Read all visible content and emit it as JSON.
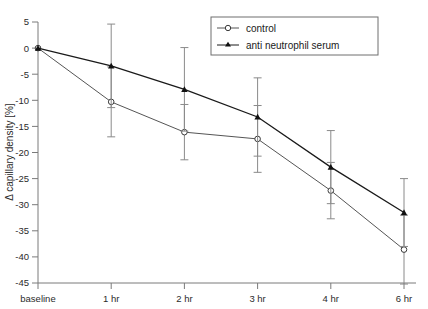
{
  "chart_data": {
    "type": "line",
    "title": "",
    "xlabel": "",
    "ylabel": "Δ capillary density [%]",
    "categories": [
      "baseline",
      "1 hr",
      "2 hr",
      "3 hr",
      "4 hr",
      "6 hr"
    ],
    "xtick_labels": [
      "baseline",
      "1 hr",
      "2 hr",
      "3 hr",
      "4 hr",
      "6 hr"
    ],
    "ytick_labels": [
      "5",
      "0",
      "-5",
      "-10",
      "-15",
      "-20",
      "-25",
      "-30",
      "-35",
      "-40",
      "-45"
    ],
    "yticks": [
      5,
      0,
      -5,
      -10,
      -15,
      -20,
      -25,
      -30,
      -35,
      -40,
      -45
    ],
    "ylim": [
      -45,
      5
    ],
    "grid": false,
    "legend_position": "top-right",
    "series": [
      {
        "name": "control",
        "marker": "open-circle",
        "color": "#555555",
        "values": [
          0,
          -10.3,
          -16.1,
          -17.4,
          -27.3,
          -38.6
        ],
        "err_low": [
          0,
          6.7,
          5.3,
          6.4,
          5.4,
          6.6
        ],
        "err_high": [
          0,
          6.7,
          5.3,
          6.4,
          5.4,
          6.6
        ]
      },
      {
        "name": "anti neutrophil serum",
        "marker": "filled-triangle",
        "color": "#1a1a1a",
        "values": [
          0,
          -3.4,
          -7.9,
          -13.2,
          -22.8,
          -31.5
        ],
        "err_low": [
          0,
          8.0,
          8.0,
          7.5,
          7.0,
          6.5
        ],
        "err_high": [
          0,
          8.0,
          8.0,
          7.5,
          7.0,
          6.5
        ]
      }
    ]
  },
  "legend": {
    "entries": [
      {
        "label": "control"
      },
      {
        "label": "anti neutrophil serum"
      }
    ]
  },
  "axes": {
    "y_axis_title": "Δ capillary density [%]"
  }
}
